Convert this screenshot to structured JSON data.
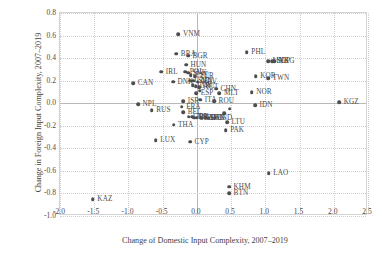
{
  "chart_data": {
    "type": "scatter",
    "title": "",
    "xlabel": "Change of Domestic Input Complexity, 2007–2019",
    "ylabel": "Change in Foreign Input Complexity, 2007–2019",
    "xlim": [
      -2.0,
      2.5
    ],
    "ylim": [
      -1.0,
      0.8
    ],
    "xticks": [
      "-2.0",
      "-1.5",
      "-1.0",
      "-0.5",
      "0.0",
      "0.5",
      "1.0",
      "1.5",
      "2.0",
      "2.5"
    ],
    "xtick_values": [
      -2.0,
      -1.5,
      -1.0,
      -0.5,
      0.0,
      0.5,
      1.0,
      1.5,
      2.0,
      2.5
    ],
    "yticks": [
      "0.8",
      "0.6",
      "0.4",
      "0.2",
      "0.0",
      "-0.2",
      "-0.4",
      "-0.6",
      "-0.8",
      "-1.0"
    ],
    "ytick_values": [
      0.8,
      0.6,
      0.4,
      0.2,
      0.0,
      -0.2,
      -0.4,
      -0.6,
      -0.8,
      -1.0
    ],
    "grid": true,
    "legend": "none",
    "marker_color": "#4d4d4d",
    "points": [
      {
        "label": "VNM",
        "x": -0.27,
        "y": 0.61
      },
      {
        "label": "BRA",
        "x": -0.3,
        "y": 0.44
      },
      {
        "label": "BGR",
        "x": -0.13,
        "y": 0.42
      },
      {
        "label": "PHL",
        "x": 0.73,
        "y": 0.45
      },
      {
        "label": "HUN",
        "x": -0.16,
        "y": 0.34
      },
      {
        "label": "MYS",
        "x": 1.04,
        "y": 0.37
      },
      {
        "label": "SGP",
        "x": 1.1,
        "y": 0.37
      },
      {
        "label": "HKG",
        "x": 1.13,
        "y": 0.37
      },
      {
        "label": "IRL",
        "x": -0.52,
        "y": 0.28
      },
      {
        "label": "POL",
        "x": -0.17,
        "y": 0.28
      },
      {
        "label": "SVK",
        "x": -0.13,
        "y": 0.27
      },
      {
        "label": "EST",
        "x": -0.09,
        "y": 0.25
      },
      {
        "label": "TUR",
        "x": -0.03,
        "y": 0.24
      },
      {
        "label": "KOR",
        "x": 0.86,
        "y": 0.24
      },
      {
        "label": "TWN",
        "x": 1.04,
        "y": 0.22
      },
      {
        "label": "CAN",
        "x": -0.93,
        "y": 0.18
      },
      {
        "label": "DNK",
        "x": -0.35,
        "y": 0.19
      },
      {
        "label": "CZE",
        "x": -0.1,
        "y": 0.2
      },
      {
        "label": "SVN",
        "x": -0.05,
        "y": 0.2
      },
      {
        "label": "HRV",
        "x": 0.01,
        "y": 0.19
      },
      {
        "label": "LVA",
        "x": -0.06,
        "y": 0.16
      },
      {
        "label": "GRC",
        "x": -0.02,
        "y": 0.15
      },
      {
        "label": "AUT",
        "x": 0.03,
        "y": 0.14
      },
      {
        "label": "CHN",
        "x": 0.28,
        "y": 0.13
      },
      {
        "label": "MLT",
        "x": 0.33,
        "y": 0.09
      },
      {
        "label": "NOR",
        "x": 0.8,
        "y": 0.1
      },
      {
        "label": "HKG2",
        "x": 0.04,
        "y": 0.11
      },
      {
        "label": "ESP",
        "x": -0.01,
        "y": 0.09
      },
      {
        "label": "ISR",
        "x": -0.2,
        "y": 0.02
      },
      {
        "label": "ITA",
        "x": 0.05,
        "y": 0.03
      },
      {
        "label": "ROU",
        "x": 0.25,
        "y": 0.02
      },
      {
        "label": "KGZ",
        "x": 2.08,
        "y": 0.01
      },
      {
        "label": "NPL",
        "x": -0.86,
        "y": -0.01
      },
      {
        "label": "FRA",
        "x": -0.22,
        "y": -0.03
      },
      {
        "label": "RUS",
        "x": -0.66,
        "y": -0.06
      },
      {
        "label": "BEL",
        "x": -0.2,
        "y": -0.08
      },
      {
        "label": "DNK2",
        "x": 0.48,
        "y": -0.05
      },
      {
        "label": "NOR2",
        "x": 0.4,
        "y": -0.09
      },
      {
        "label": "IDN",
        "x": 0.85,
        "y": -0.02
      },
      {
        "label": "GBR",
        "x": -0.12,
        "y": -0.12
      },
      {
        "label": "JPN",
        "x": -0.07,
        "y": -0.12
      },
      {
        "label": "USA",
        "x": -0.04,
        "y": -0.13
      },
      {
        "label": "NLD",
        "x": 0.0,
        "y": -0.13
      },
      {
        "label": "CHE",
        "x": 0.06,
        "y": -0.13
      },
      {
        "label": "SWE",
        "x": 0.12,
        "y": -0.13
      },
      {
        "label": "FIN",
        "x": 0.17,
        "y": -0.13
      },
      {
        "label": "IND",
        "x": 0.26,
        "y": -0.13
      },
      {
        "label": "THA",
        "x": -0.34,
        "y": -0.19
      },
      {
        "label": "LTU",
        "x": 0.44,
        "y": -0.17
      },
      {
        "label": "PAK",
        "x": 0.42,
        "y": -0.24
      },
      {
        "label": "LUX",
        "x": -0.6,
        "y": -0.33
      },
      {
        "label": "CYP",
        "x": -0.1,
        "y": -0.34
      },
      {
        "label": "LAO",
        "x": 1.05,
        "y": -0.62
      },
      {
        "label": "KHM",
        "x": 0.47,
        "y": -0.74
      },
      {
        "label": "BTN",
        "x": 0.47,
        "y": -0.8
      },
      {
        "label": "KAZ",
        "x": -1.52,
        "y": -0.85
      }
    ]
  }
}
